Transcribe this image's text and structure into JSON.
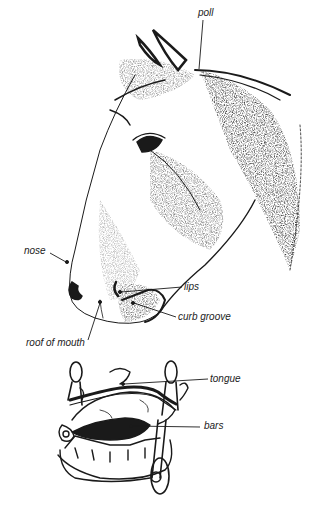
{
  "diagram": {
    "colors": {
      "ink": "#1a1a1a",
      "label": "#222222",
      "background": "#ffffff"
    },
    "figures": [
      {
        "id": "horse-head",
        "description": "Stippled ink drawing of a horse's head in profile, facing left"
      },
      {
        "id": "mouth-with-bit",
        "description": "Line drawing of an open horse mouth with a curb bit in place"
      }
    ],
    "labels": {
      "poll": "poll",
      "nose": "nose",
      "lips": "lips",
      "curb_groove": "curb groove",
      "roof_of_mouth": "roof of mouth",
      "tongue": "tongue",
      "bars": "bars"
    }
  }
}
